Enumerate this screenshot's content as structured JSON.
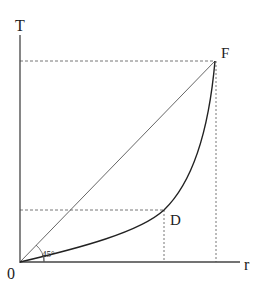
{
  "diagram": {
    "axes": {
      "y_label": "T",
      "x_label": "r",
      "origin_label": "0"
    },
    "points": {
      "F": {
        "label": "F"
      },
      "D": {
        "label": "D"
      }
    },
    "angle_label": "45°",
    "elements": [
      "45-degree diagonal line from origin to F",
      "convex curve from origin through D to F",
      "dashed projections from F to both axes",
      "dashed projections from D to both axes"
    ]
  }
}
